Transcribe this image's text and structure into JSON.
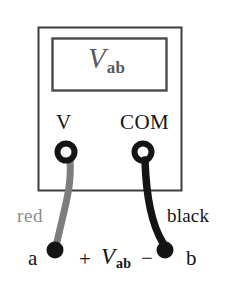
{
  "figure": {
    "background_color": "#ffffff"
  },
  "meter": {
    "body": {
      "border_color": "#3c3c3c",
      "fill_color": "#ffffff",
      "x": 38,
      "y": 27,
      "width": 143,
      "height": 163
    },
    "display": {
      "border_color": "#4a4a4a",
      "fill_color": "#ffffff",
      "x": 52,
      "y": 38,
      "width": 114,
      "height": 52,
      "reading_symbol": "V",
      "reading_subscript": "ab",
      "reading_color": "#5a5a5a"
    },
    "terminals": [
      {
        "id": "terminal-v",
        "label": "V",
        "jack_color": "#141414",
        "cx": 66,
        "cy": 152,
        "outer_r": 11,
        "inner_r": 6
      },
      {
        "id": "terminal-com",
        "label": "COM",
        "jack_color": "#141414",
        "cx": 143,
        "cy": 152,
        "outer_r": 11,
        "inner_r": 6
      }
    ]
  },
  "leads": [
    {
      "id": "lead-red",
      "label": "red",
      "color": "#7d7d7d",
      "label_color": "#8c8c8c",
      "from_terminal": "terminal-v",
      "to_node": "node-a"
    },
    {
      "id": "lead-black",
      "label": "black",
      "color": "#141414",
      "label_color": "#141414",
      "from_terminal": "terminal-com",
      "to_node": "node-b"
    }
  ],
  "nodes": [
    {
      "id": "node-a",
      "label": "a",
      "cx": 55,
      "cy": 250,
      "r": 8,
      "color": "#141414"
    },
    {
      "id": "node-b",
      "label": "b",
      "cx": 165,
      "cy": 250,
      "r": 8,
      "color": "#141414"
    }
  ],
  "polarity": {
    "plus_sign": "+",
    "minus_sign": "−",
    "voltage_symbol": "V",
    "voltage_subscript": "ab"
  }
}
